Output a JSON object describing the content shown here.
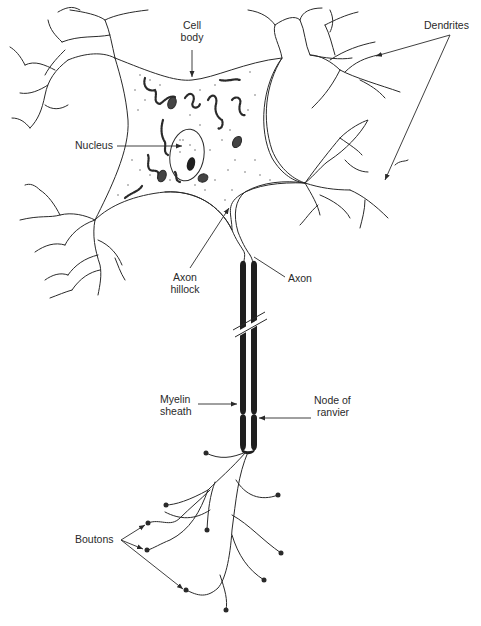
{
  "diagram": {
    "colors": {
      "ink": "#2a2a2a",
      "background": "#ffffff",
      "myelin": "#1f1f1f"
    },
    "labels": {
      "cell_body_1": "Cell",
      "cell_body_2": "body",
      "dendrites": "Dendrites",
      "nucleus": "Nucleus",
      "axon_hillock_1": "Axon",
      "axon_hillock_2": "hillock",
      "axon": "Axon",
      "myelin_sheath_1": "Myelin",
      "myelin_sheath_2": "sheath",
      "node_of_ranvier_1": "Node of",
      "node_of_ranvier_2": "ranvier",
      "boutons": "Boutons"
    },
    "components": [
      "Cell body",
      "Dendrites",
      "Nucleus",
      "Axon hillock",
      "Axon",
      "Myelin sheath",
      "Node of ranvier",
      "Boutons"
    ]
  }
}
